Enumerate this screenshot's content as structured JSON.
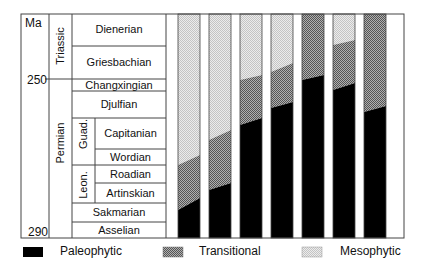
{
  "chart_data": {
    "type": "stacked-bar",
    "title": "",
    "ylabel": "Ma",
    "y_ticks": [
      {
        "label": "250",
        "value": 250
      },
      {
        "label": "290",
        "value": 290
      }
    ],
    "timescale": {
      "periods": [
        "Triassic",
        "Permian"
      ],
      "series": [
        "Guad.",
        "Leon."
      ],
      "stages": [
        "Dienerian",
        "Griesbachian",
        "Changxingian",
        "Djulfian",
        "Capitanian",
        "Wordian",
        "Roadian",
        "Artinskian",
        "Sakmarian",
        "Asselian"
      ]
    },
    "legend": [
      "Paleophytic",
      "Transitional",
      "Mesophytic"
    ],
    "legend_position": "bottom",
    "bars": 7,
    "series": [
      {
        "name": "Paleophytic",
        "top_left_y": [
          210,
          190,
          125,
          108,
          80,
          90,
          112
        ],
        "top_right_y": [
          198,
          183,
          118,
          102,
          75,
          83,
          106
        ]
      },
      {
        "name": "Transitional",
        "top_left_y": [
          165,
          140,
          80,
          72,
          14,
          45,
          14
        ],
        "top_right_y": [
          155,
          130,
          75,
          63,
          14,
          40,
          14
        ]
      },
      {
        "name": "Mesophytic",
        "top_left_y": [
          14,
          14,
          14,
          14,
          14,
          14,
          14
        ],
        "top_right_y": [
          14,
          14,
          14,
          14,
          14,
          14,
          14
        ]
      }
    ],
    "colors": {
      "Paleophytic": "#000000",
      "Transitional": "#8a8a8a",
      "Mesophytic": "#d8d8d8"
    }
  },
  "axis": {
    "unit": "Ma",
    "tick_250": "250",
    "tick_290": "290"
  },
  "periods": {
    "triassic": "Triassic",
    "permian": "Permian"
  },
  "series_labels": {
    "guad": "Guad.",
    "leon": "Leon."
  },
  "stages": {
    "dienerian": "Dienerian",
    "griesbachian": "Griesbachian",
    "changxingian": "Changxingian",
    "djulfian": "Djulfian",
    "capitanian": "Capitanian",
    "wordian": "Wordian",
    "roadian": "Roadian",
    "artinskian": "Artinskian",
    "sakmarian": "Sakmarian",
    "asselian": "Asselian"
  },
  "legend": {
    "paleophytic": "Paleophytic",
    "transitional": "Transitional",
    "mesophytic": "Mesophytic"
  }
}
